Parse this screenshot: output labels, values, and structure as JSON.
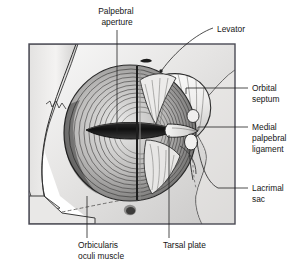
{
  "figure": {
    "type": "anatomical-illustration",
    "style": "grayscale pen-and-ink with tonal shading",
    "background_color": "#ffffff",
    "frame": {
      "border_color": "#4a4a55",
      "x": 29,
      "y": 44,
      "width": 206,
      "height": 180
    },
    "colors": {
      "bone_light": "#f2f1f0",
      "bone_mid": "#d8d7d6",
      "bone_shadow": "#b0afae",
      "muscle_light": "#e8e7e6",
      "muscle_mid": "#a9a8a7",
      "muscle_dark": "#5d5c5b",
      "aperture_dark": "#141414",
      "septum_light": "#f6f6f5",
      "ink": "#222222",
      "label_text": "#161616"
    }
  },
  "labels": [
    {
      "id": "palpebral-aperture",
      "name": "Palpebral aperture",
      "lines": [
        "Palpebral",
        "aperture"
      ],
      "position": "top-center",
      "text_x": 103,
      "text_y": 14,
      "leader": "vertical line down from text to the dark eyelid slit",
      "anchor_x": 136,
      "anchor_y": 133
    },
    {
      "id": "levator",
      "name": "Levator",
      "lines": [
        "Levator"
      ],
      "position": "top-right",
      "text_x": 217,
      "text_y": 29,
      "leader": "diagonal line down-left to upper eyelid",
      "anchor_x": 155,
      "anchor_y": 78
    },
    {
      "id": "orbital-septum",
      "name": "Orbital septum",
      "lines": [
        "Orbital",
        "septum"
      ],
      "position": "right-upper",
      "text_x": 252,
      "text_y": 90,
      "leader": "horizontal line left into the septum sheet",
      "anchor_x": 186,
      "anchor_y": 94
    },
    {
      "id": "medial-palpebral-ligament",
      "name": "Medial palpebral ligament",
      "lines": [
        "Medial",
        "palpebral",
        "ligament"
      ],
      "position": "right-middle",
      "text_x": 252,
      "text_y": 128,
      "leader": "horizontal line left to the medial canthal band",
      "anchor_x": 196,
      "anchor_y": 131
    },
    {
      "id": "lacrimal-sac",
      "name": "Lacrimal sac",
      "lines": [
        "Lacrimal",
        "sac"
      ],
      "position": "right-lower",
      "text_x": 252,
      "text_y": 190,
      "leader": "line left then up to the lacrimal fossa",
      "anchor_x": 200,
      "anchor_y": 139
    },
    {
      "id": "orbicularis-oculi-muscle",
      "name": "Orbicularis oculi muscle",
      "lines": [
        "Orbicularis",
        "oculi muscle"
      ],
      "position": "bottom-left",
      "text_x": 78,
      "text_y": 246,
      "leader": "vertical line up into the muscle fibers",
      "anchor_x": 86,
      "anchor_y": 196
    },
    {
      "id": "tarsal-plate",
      "name": "Tarsal plate",
      "lines": [
        "Tarsal plate"
      ],
      "position": "bottom-center",
      "text_x": 165,
      "text_y": 246,
      "leader": "vertical line up to the lower tarsal plate",
      "anchor_x": 168,
      "anchor_y": 130
    }
  ],
  "structures": [
    {
      "id": "orbital-bone",
      "name": "Orbital bone margin"
    },
    {
      "id": "orbicularis-fibers",
      "name": "Orbicularis oculi concentric fibers"
    },
    {
      "id": "palpebral-slit",
      "name": "Palpebral aperture slit"
    },
    {
      "id": "orbital-septum-sheet",
      "name": "Orbital septum"
    },
    {
      "id": "medial-canthal-band",
      "name": "Medial palpebral ligament band"
    },
    {
      "id": "lacrimal-sac-body",
      "name": "Lacrimal sac"
    },
    {
      "id": "supraorbital-notch",
      "name": "Supraorbital notch"
    },
    {
      "id": "infraorbital-foramen",
      "name": "Infraorbital foramen"
    },
    {
      "id": "zygomatic-suture",
      "name": "Zygomatic suture (dashed)"
    }
  ]
}
